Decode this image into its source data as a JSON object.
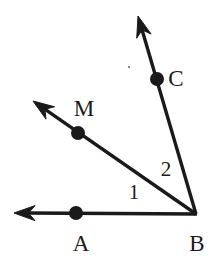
{
  "figure": {
    "width": 217,
    "height": 261,
    "background_color": "#ffffff",
    "stroke_color": "#1a1a1a",
    "stroke_width": 3.4,
    "dot_color": "#1a1a1a",
    "dot_radius": 7
  },
  "vertex": {
    "name": "B",
    "label": "B",
    "x": 197,
    "y": 215,
    "label_x": 197,
    "label_y": 243
  },
  "rays": [
    {
      "id": "ray-ba",
      "name": "ray-b-to-a",
      "from_x": 197,
      "from_y": 214,
      "to_x": 14,
      "to_y": 213,
      "arrowhead": true,
      "point": {
        "label": "A",
        "dot_x": 76,
        "dot_y": 213,
        "label_x": 81,
        "label_y": 243
      }
    },
    {
      "id": "ray-bm",
      "name": "ray-b-to-m",
      "from_x": 196,
      "from_y": 214,
      "to_x": 33,
      "to_y": 101,
      "arrowhead": true,
      "point": {
        "label": "M",
        "dot_x": 78,
        "dot_y": 133,
        "label_x": 84,
        "label_y": 108
      }
    },
    {
      "id": "ray-bc",
      "name": "ray-b-to-c",
      "from_x": 196,
      "from_y": 214,
      "to_x": 138,
      "to_y": 16,
      "arrowhead": true,
      "point": {
        "label": "C",
        "dot_x": 157,
        "dot_y": 79,
        "label_x": 176,
        "label_y": 78
      }
    }
  ],
  "angle_labels": [
    {
      "id": "angle-1",
      "name": "angle-label-1",
      "label": "1",
      "x": 134,
      "y": 192,
      "between": "ray BA and ray BM"
    },
    {
      "id": "angle-2",
      "name": "angle-label-2",
      "label": "2",
      "x": 166,
      "y": 169,
      "between": "ray BM and ray BC"
    }
  ],
  "artifacts": [
    {
      "id": "speck",
      "x": 129,
      "y": 67
    }
  ]
}
